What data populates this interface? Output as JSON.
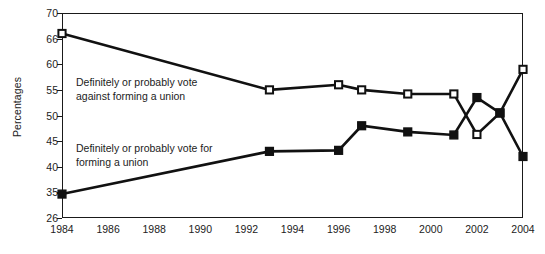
{
  "chart_data": {
    "type": "line",
    "title": "",
    "xlabel": "",
    "ylabel": "Percentages",
    "xlim": [
      1984,
      2004
    ],
    "ylim": [
      26,
      70
    ],
    "grid": false,
    "legend_position": "inline-annotations",
    "x_tick_labels": [
      "1984",
      "1986",
      "1988",
      "1990",
      "1992",
      "1994",
      "1996",
      "1998",
      "2000",
      "2002",
      "2004"
    ],
    "y_tick_labels": [
      "70",
      "66",
      "60",
      "55",
      "50",
      "45",
      "40",
      "35",
      "26"
    ],
    "series": [
      {
        "name": "Definitely or probably vote against forming a union",
        "marker": "open-square",
        "x": [
          1984,
          1993,
          1996,
          1997,
          1999,
          2001,
          2002,
          2003,
          2004
        ],
        "values": [
          66.8,
          55.0,
          56.0,
          55.0,
          54.2,
          54.2,
          46.3,
          50.5,
          59.0
        ]
      },
      {
        "name": "Definitely or probably vote for forming a union",
        "marker": "filled-square",
        "x": [
          1984,
          1993,
          1996,
          1997,
          1999,
          2001,
          2002,
          2003,
          2004
        ],
        "values": [
          34.4,
          43.0,
          43.2,
          48.0,
          46.8,
          46.2,
          53.5,
          50.5,
          42.0
        ]
      }
    ],
    "annotations": [
      {
        "id": "against",
        "text": "Definitely or probably vote\nagainst forming a union"
      },
      {
        "id": "for",
        "text": "Definitely or probably vote for\nforming a union"
      }
    ]
  }
}
